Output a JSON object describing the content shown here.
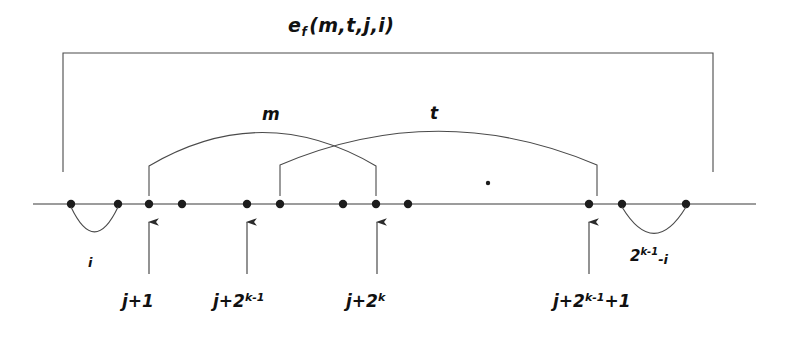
{
  "figure": {
    "type": "diagram",
    "background_color": "#ffffff",
    "stroke_color": "#3a3a3a",
    "text_color": "#111111",
    "width": 791,
    "height": 337
  },
  "title": {
    "base": "e",
    "subscript": "f",
    "args": "(m,t,j,i)",
    "full": "e_f (m, t, j, i)"
  },
  "span_bracket": {
    "name": "outer-span-bracket",
    "x_left": 63,
    "x_right": 713,
    "y_top": 53,
    "y_bottom": 172
  },
  "number_line": {
    "y": 204,
    "x_start": 33,
    "x_end": 756,
    "dots": [
      71,
      118,
      149,
      182,
      247,
      280,
      343,
      376,
      408,
      589,
      622,
      686
    ]
  },
  "stray_dot": {
    "x": 488,
    "y": 183
  },
  "arcs": [
    {
      "name": "arc-m",
      "label": "m",
      "label_x": 262,
      "label_y": 106,
      "x_start": 149,
      "x_end": 376,
      "peak_y": 128,
      "stem_bottom_y": 196
    },
    {
      "name": "arc-t",
      "label": "t",
      "label_x": 430,
      "label_y": 105,
      "x_start": 280,
      "x_end": 597,
      "peak_y": 127,
      "stem_bottom_y": 196
    }
  ],
  "under_arcs": [
    {
      "name": "under-arc-i",
      "label": "i",
      "label_x": 88,
      "label_y": 256,
      "x_start": 71,
      "x_end": 118,
      "depth_y": 238
    },
    {
      "name": "under-arc-2k1-minus-i",
      "label_base": "2",
      "label_sup": "k-1",
      "label_tail": "-i",
      "label_x": 630,
      "label_y": 247,
      "x_start": 622,
      "x_end": 686,
      "depth_y": 240
    }
  ],
  "tick_arrows": [
    {
      "name": "tick-j-plus-1",
      "x": 149,
      "tip_y": 222,
      "tail_y": 274,
      "label_base": "j+1",
      "label_sup": "",
      "label_tail": "",
      "label_x": 122,
      "label_y": 292
    },
    {
      "name": "tick-j-plus-2-pow-k-minus-1",
      "x": 247,
      "tip_y": 222,
      "tail_y": 274,
      "label_base": "j+2",
      "label_sup": "k-1",
      "label_tail": "",
      "label_x": 213,
      "label_y": 292
    },
    {
      "name": "tick-j-plus-2-pow-k",
      "x": 377,
      "tip_y": 222,
      "tail_y": 274,
      "label_base": "j+2",
      "label_sup": "k",
      "label_tail": "",
      "label_x": 346,
      "label_y": 292
    },
    {
      "name": "tick-j-plus-2-pow-k-minus-1-plus-1",
      "x": 589,
      "tip_y": 222,
      "tail_y": 274,
      "label_base": "j+2",
      "label_sup": "k-1",
      "label_tail": "+1",
      "label_x": 553,
      "label_y": 292
    }
  ]
}
